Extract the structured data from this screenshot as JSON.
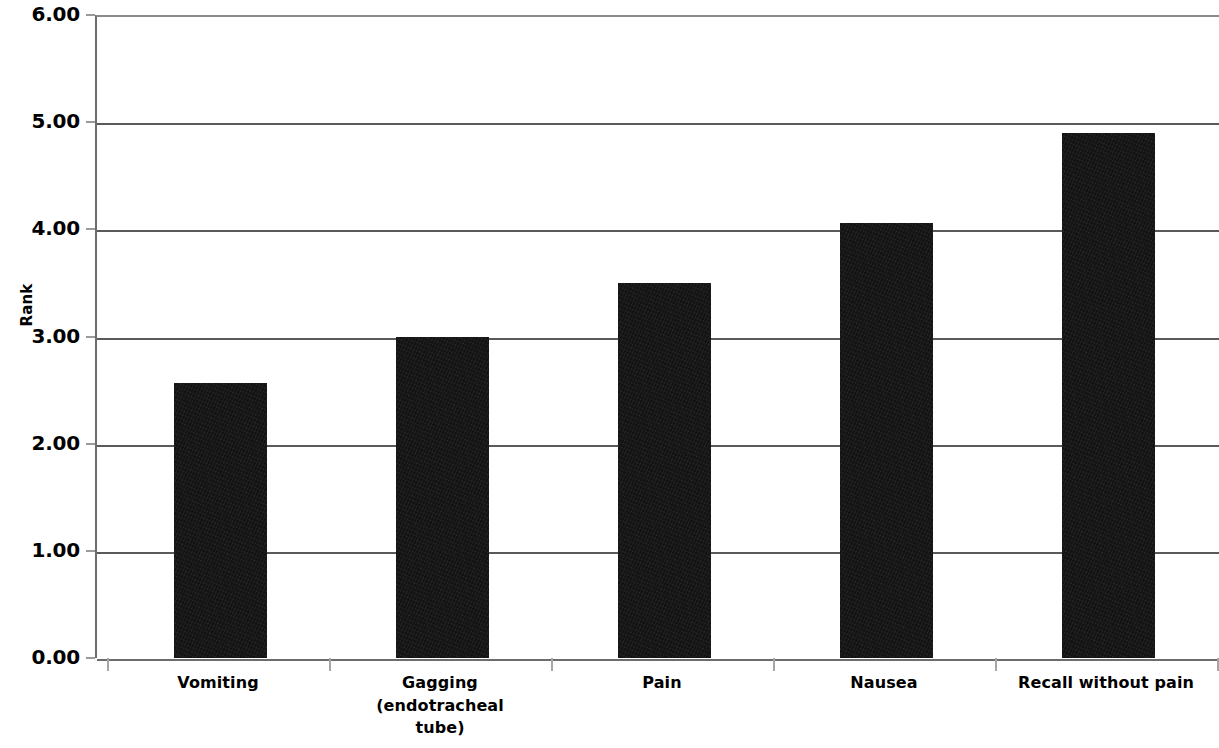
{
  "chart_data": {
    "type": "bar",
    "title": "",
    "xlabel": "",
    "ylabel": "Rank",
    "categories": [
      "Vomiting",
      "Gagging\n(endotracheal\ntube)",
      "Pain",
      "Nausea",
      "Recall without pain"
    ],
    "values": [
      2.57,
      3.0,
      3.5,
      4.06,
      4.9
    ],
    "ylim": [
      0.0,
      6.0
    ],
    "ytick_labels": [
      "6.00",
      "5.00",
      "4.00",
      "3.00",
      "2.00",
      "1.00",
      "0.00"
    ],
    "ytick_values": [
      6.0,
      5.0,
      4.0,
      3.0,
      2.0,
      1.0,
      0.0
    ],
    "grid": true,
    "legend": null,
    "series": [
      {
        "name": "Rank",
        "color": "#131313",
        "values": [
          2.57,
          3.0,
          3.5,
          4.06,
          4.9
        ]
      }
    ]
  }
}
